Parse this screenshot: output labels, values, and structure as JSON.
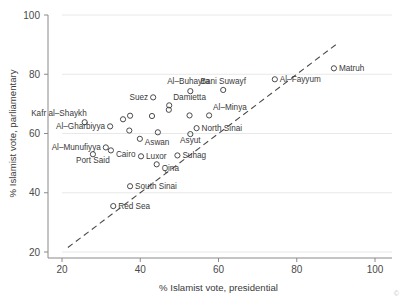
{
  "chart_data": {
    "type": "scatter",
    "title": "",
    "xlabel": "% Islamist vote, presidential",
    "ylabel": "% Islamist vote, parliamentary",
    "xlim": [
      20,
      100
    ],
    "ylim": [
      20,
      100
    ],
    "xticks": [
      20,
      40,
      60,
      80,
      100
    ],
    "yticks": [
      20,
      40,
      60,
      80,
      100
    ],
    "xticklabels": [
      "20",
      "40",
      "60",
      "80",
      "100"
    ],
    "yticklabels": [
      "20",
      "40",
      "60",
      "80",
      "100"
    ],
    "grid": "horizontal",
    "legend": "none",
    "marker_style": "open-circle",
    "reference_line": {
      "type": "dashed-diagonal",
      "x_start": 21.5,
      "y_start": 21.5,
      "x_end": 90.5,
      "y_end": 90.5,
      "note": "45-degree identity line"
    },
    "points": [
      {
        "label": "Kafr al–Shaykh",
        "x": 25.8,
        "y": 63.8,
        "label_pos": "left-above"
      },
      {
        "label": "Al–Gharbiyya",
        "x": 32.3,
        "y": 62.4,
        "label_pos": "left"
      },
      {
        "label": "Al–Munufiyya",
        "x": 31.2,
        "y": 55.3,
        "label_pos": "left"
      },
      {
        "label": "Cairo",
        "x": 32.5,
        "y": 54.3,
        "label_pos": "right-below"
      },
      {
        "label": "Port Said",
        "x": 27.9,
        "y": 53.0,
        "label_pos": "below"
      },
      {
        "label": "Red Sea",
        "x": 33.1,
        "y": 35.5,
        "label_pos": "right"
      },
      {
        "label": "South Sinai",
        "x": 37.4,
        "y": 42.2,
        "label_pos": "right"
      },
      {
        "label": "Aswan",
        "x": 39.9,
        "y": 58.2,
        "label_pos": "right-below"
      },
      {
        "label": "Luxor",
        "x": 40.2,
        "y": 52.3,
        "label_pos": "right"
      },
      {
        "label": "Qina",
        "x": 44.2,
        "y": 49.6,
        "label_pos": "right-below"
      },
      {
        "label": "Suez",
        "x": 43.3,
        "y": 72.2,
        "label_pos": "left"
      },
      {
        "label": "Al–Buhayra",
        "x": 52.8,
        "y": 74.3,
        "label_pos": "above-left"
      },
      {
        "label": "Damietta",
        "x": 47.4,
        "y": 69.5,
        "label_pos": "right-above"
      },
      {
        "label": "Suhag",
        "x": 49.5,
        "y": 52.6,
        "label_pos": "right"
      },
      {
        "label": "Asyut",
        "x": 52.8,
        "y": 59.8,
        "label_pos": "below"
      },
      {
        "label": "North Sinai",
        "x": 54.4,
        "y": 61.8,
        "label_pos": "right"
      },
      {
        "label": "Al–Minya",
        "x": 57.6,
        "y": 66.1,
        "label_pos": "right-above"
      },
      {
        "label": "Bani Suwayf",
        "x": 61.2,
        "y": 74.7,
        "label_pos": "above"
      },
      {
        "label": "Al–Fayyum",
        "x": 74.4,
        "y": 78.3,
        "label_pos": "right"
      },
      {
        "label": "Matruh",
        "x": 89.5,
        "y": 82.0,
        "label_pos": "right"
      },
      {
        "label": "",
        "x": 35.6,
        "y": 64.8,
        "label_pos": "none"
      },
      {
        "label": "",
        "x": 37.4,
        "y": 66.0,
        "label_pos": "none"
      },
      {
        "label": "",
        "x": 43.0,
        "y": 65.9,
        "label_pos": "none"
      },
      {
        "label": "",
        "x": 52.6,
        "y": 66.1,
        "label_pos": "none"
      },
      {
        "label": "",
        "x": 37.2,
        "y": 61.0,
        "label_pos": "none"
      },
      {
        "label": "",
        "x": 44.5,
        "y": 60.4,
        "label_pos": "none"
      },
      {
        "label": "",
        "x": 47.3,
        "y": 68.0,
        "label_pos": "none"
      }
    ]
  },
  "figure": {
    "corner_mark": "©"
  }
}
